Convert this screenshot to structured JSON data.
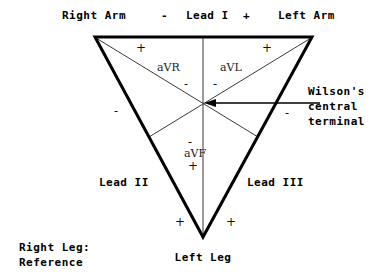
{
  "diagram": {
    "type": "ecg-lead-vector-diagram",
    "background_color": "#ffffff",
    "stroke_color": "#000000",
    "thin_stroke_color": "#333333"
  },
  "vertices": {
    "right_arm_label": "Right Arm",
    "left_arm_label": "Left Arm",
    "left_leg_label": "Left Leg"
  },
  "lead_i": {
    "minus": "-",
    "name": "Lead I",
    "plus": "+"
  },
  "leads": {
    "lead_ii": "Lead II",
    "lead_iii": "Lead III"
  },
  "augmented": {
    "avr": {
      "label": "aVR",
      "plus": "+",
      "minus": "-"
    },
    "avl": {
      "label": "aVL",
      "plus": "+",
      "minus": "-"
    },
    "avf": {
      "label": "aVF",
      "plus": "+",
      "minus": "-"
    }
  },
  "wilson": {
    "line1": "Wilson's",
    "line2": "central",
    "line3": "terminal"
  },
  "reference": {
    "line1": "Right Leg:",
    "line2": "Reference"
  },
  "polarity_marks": {
    "left_minus": "-",
    "right_minus": "-",
    "bottom_left_plus": "+",
    "bottom_right_plus": "+"
  }
}
